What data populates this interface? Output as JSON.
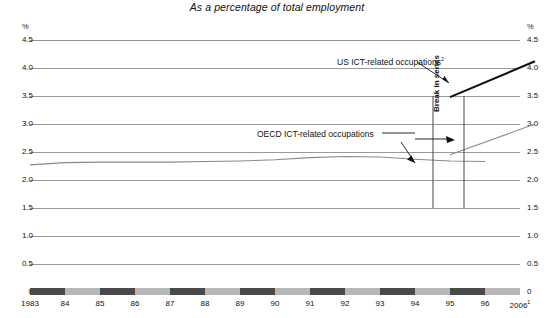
{
  "chart_data": {
    "type": "line",
    "title": "As a percentage of total employment",
    "xlabel": "",
    "ylabel": "%",
    "ylim": [
      0,
      4.5
    ],
    "ytick_labels": [
      "4.5",
      "4.0",
      "3.5",
      "3.0",
      "2.5",
      "2.0",
      "1.5",
      "1.0",
      "0.5",
      "0"
    ],
    "ytick_values": [
      4.5,
      4.0,
      3.5,
      3.0,
      2.5,
      2.0,
      1.5,
      1.0,
      0.5,
      0
    ],
    "xtick_labels": [
      "1983",
      "84",
      "85",
      "86",
      "87",
      "88",
      "89",
      "90",
      "91",
      "92",
      "93",
      "94",
      "95",
      "96",
      "2006"
    ],
    "xtick_last_superscript": "1",
    "grid": true,
    "legend_position": "inline-annotations",
    "series": [
      {
        "name": "OECD ICT-related occupations",
        "color": "#8a8a8a",
        "x": [
          1983,
          1984,
          1985,
          1986,
          1987,
          1988,
          1989,
          1990,
          1991,
          1992,
          1993,
          1994,
          1995,
          1996
        ],
        "values": [
          2.27,
          2.31,
          2.32,
          2.32,
          2.32,
          2.33,
          2.34,
          2.36,
          2.4,
          2.42,
          2.41,
          2.37,
          2.34,
          2.33
        ],
        "post_break_x": [
          1997,
          2006
        ],
        "post_break_values": [
          2.45,
          3.0
        ]
      },
      {
        "name": "US ICT-related occupations",
        "color": "#111111",
        "superscript": "2",
        "post_break_x": [
          1997,
          2006
        ],
        "post_break_values": [
          3.48,
          4.12
        ]
      }
    ],
    "annotations": [
      {
        "text": "US ICT-related occupations",
        "superscript": "2",
        "target": "us-line"
      },
      {
        "text": "OECD ICT-related occupations",
        "target": "oecd-line"
      },
      {
        "text": "Break in series",
        "orientation": "vertical",
        "between_years": [
          1996,
          2006
        ]
      }
    ]
  },
  "axis": {
    "unit_left": "%",
    "unit_right": "%"
  },
  "annotations": {
    "us_label": "US ICT-related occupations",
    "us_superscript": "2",
    "oecd_label": "OECD ICT-related occupations",
    "break_label": "Break in series"
  },
  "colors": {
    "oecd_line": "#8a8a8a",
    "us_line": "#111111",
    "gridline": "#9a9a9a",
    "axis_dark": "#4a4a4a",
    "axis_light": "#b8b8b8"
  }
}
